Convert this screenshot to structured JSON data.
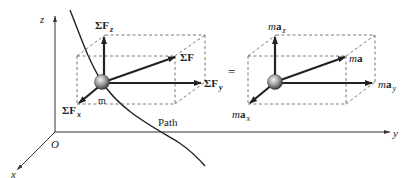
{
  "axes": {
    "z_label": "z",
    "y_label": "y",
    "x_label": "x",
    "origin_label": "O"
  },
  "path_label": "Path",
  "mass_label": "m",
  "equals": "=",
  "left_diagram": {
    "sum_symbol": "ΣF",
    "resultant": "ΣF",
    "component_z": {
      "main": "ΣF",
      "sub": "z"
    },
    "component_y": {
      "main": "ΣF",
      "sub": "y"
    },
    "component_x": {
      "main": "ΣF",
      "sub": "x"
    }
  },
  "right_diagram": {
    "resultant": {
      "m": "m",
      "a": "a"
    },
    "component_z": {
      "m": "m",
      "a": "a",
      "sub": "z"
    },
    "component_y": {
      "m": "m",
      "a": "a",
      "sub": "y"
    },
    "component_x": {
      "m": "m",
      "a": "a",
      "sub": "x"
    }
  },
  "colors": {
    "line": "#222222",
    "dashed": "#555555",
    "sphere_light": "#f2f2f2",
    "sphere_dark": "#4a4a4a"
  }
}
